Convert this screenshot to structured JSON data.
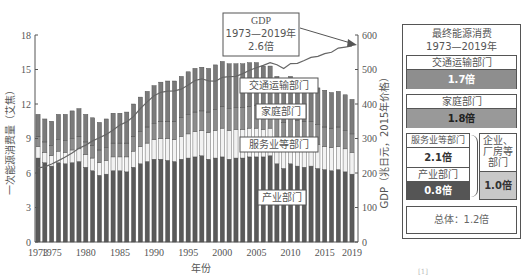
{
  "chart_data": {
    "type": "bar",
    "subtype": "stacked_bar_with_line",
    "title": "",
    "xlabel": "年份",
    "ylabel": "一次能源消费量（艾焦）",
    "y2label": "GDP（兆日元，2015年价格）",
    "ylim": [
      0,
      18
    ],
    "y2lim": [
      0,
      600
    ],
    "yticks": [
      0,
      3,
      6,
      9,
      12,
      15,
      18
    ],
    "y2ticks": [
      0,
      100,
      200,
      300,
      400,
      500,
      600
    ],
    "xtick_labels": [
      "1973",
      "1975",
      "1980",
      "1985",
      "1990",
      "1995",
      "2000",
      "2005",
      "2010",
      "2015",
      "2019"
    ],
    "categories": [
      1973,
      1974,
      1975,
      1976,
      1977,
      1978,
      1979,
      1980,
      1981,
      1982,
      1983,
      1984,
      1985,
      1986,
      1987,
      1988,
      1989,
      1990,
      1991,
      1992,
      1993,
      1994,
      1995,
      1996,
      1997,
      1998,
      1999,
      2000,
      2001,
      2002,
      2003,
      2004,
      2005,
      2006,
      2007,
      2008,
      2009,
      2010,
      2011,
      2012,
      2013,
      2014,
      2015,
      2016,
      2017,
      2018,
      2019
    ],
    "series": [
      {
        "name": "产业部门",
        "color": "#5a5a5a",
        "values": [
          7.3,
          6.9,
          6.6,
          6.9,
          6.8,
          6.9,
          7.0,
          6.5,
          6.2,
          5.8,
          5.9,
          6.2,
          6.2,
          6.1,
          6.5,
          6.8,
          7.0,
          7.2,
          7.2,
          7.1,
          7.0,
          7.2,
          7.3,
          7.4,
          7.5,
          7.2,
          7.3,
          7.4,
          7.2,
          7.3,
          7.3,
          7.4,
          7.4,
          7.4,
          7.5,
          6.8,
          6.4,
          6.8,
          6.6,
          6.5,
          6.6,
          6.4,
          6.3,
          6.2,
          6.3,
          6.1,
          5.9
        ]
      },
      {
        "name": "服务业等部门",
        "color": "#f2f2f2",
        "values": [
          1.0,
          0.9,
          0.9,
          1.0,
          1.0,
          1.1,
          1.1,
          1.1,
          1.1,
          1.1,
          1.2,
          1.2,
          1.2,
          1.3,
          1.4,
          1.5,
          1.6,
          1.7,
          1.8,
          1.9,
          1.9,
          2.0,
          2.1,
          2.2,
          2.2,
          2.3,
          2.4,
          2.5,
          2.5,
          2.5,
          2.5,
          2.5,
          2.5,
          2.4,
          2.4,
          2.3,
          2.2,
          2.3,
          2.2,
          2.2,
          2.1,
          2.1,
          2.0,
          2.0,
          2.0,
          2.0,
          1.9
        ]
      },
      {
        "name": "家庭部门",
        "color": "#8c8c8c",
        "values": [
          0.9,
          0.9,
          0.9,
          1.0,
          1.0,
          1.0,
          1.1,
          1.1,
          1.1,
          1.1,
          1.1,
          1.2,
          1.2,
          1.2,
          1.3,
          1.3,
          1.4,
          1.4,
          1.5,
          1.5,
          1.6,
          1.6,
          1.7,
          1.7,
          1.7,
          1.8,
          1.8,
          1.9,
          1.9,
          1.9,
          1.9,
          1.9,
          2.0,
          1.9,
          1.9,
          1.9,
          1.8,
          1.9,
          1.8,
          1.8,
          1.8,
          1.7,
          1.7,
          1.7,
          1.7,
          1.6,
          1.6
        ]
      },
      {
        "name": "交通运输部门",
        "color": "#7a7a7a",
        "values": [
          1.9,
          2.0,
          2.1,
          2.2,
          2.3,
          2.4,
          2.4,
          2.4,
          2.4,
          2.4,
          2.5,
          2.6,
          2.6,
          2.7,
          2.8,
          3.0,
          3.1,
          3.3,
          3.4,
          3.5,
          3.5,
          3.6,
          3.7,
          3.8,
          3.8,
          3.8,
          3.9,
          3.9,
          3.9,
          3.8,
          3.8,
          3.8,
          3.7,
          3.6,
          3.5,
          3.4,
          3.3,
          3.4,
          3.3,
          3.3,
          3.2,
          3.2,
          3.2,
          3.1,
          3.1,
          3.1,
          3.0
        ]
      },
      {
        "name": "GDP",
        "type": "line",
        "axis": "y2",
        "color": "#666666",
        "values": [
          215,
          218,
          226,
          236,
          246,
          258,
          272,
          281,
          293,
          302,
          312,
          325,
          339,
          348,
          364,
          387,
          406,
          424,
          434,
          437,
          438,
          443,
          455,
          468,
          473,
          467,
          466,
          477,
          479,
          480,
          488,
          498,
          505,
          512,
          520,
          514,
          503,
          517,
          518,
          526,
          535,
          538,
          546,
          550,
          562,
          565,
          568
        ]
      }
    ],
    "annotations": [
      {
        "text": "GDP\n1973—2019年\n2.6倍",
        "target": "GDP line end"
      },
      {
        "text": "交通运输部门"
      },
      {
        "text": "家庭部门"
      },
      {
        "text": "服务业等部门"
      },
      {
        "text": "产业部门"
      }
    ],
    "grid": false,
    "legend_position": "inline labels"
  },
  "axes": {
    "xlabel": "年份",
    "ylabel": "一次能源消费量（艾焦）",
    "y2label": "GDP（兆日元，2015年价格）",
    "yticks": [
      "0",
      "3",
      "6",
      "9",
      "12",
      "15",
      "18"
    ],
    "y2ticks": [
      "0",
      "100",
      "200",
      "300",
      "400",
      "500",
      "600"
    ],
    "xticks": [
      "1973",
      "1975",
      "1980",
      "1985",
      "1990",
      "1995",
      "2000",
      "2005",
      "2010",
      "2015",
      "2019"
    ]
  },
  "labels": {
    "gdp_box": [
      "GDP",
      "1973—2019年",
      "2.6倍"
    ],
    "transport": "交通运输部门",
    "household": "家庭部门",
    "services": "服务业等部门",
    "industry": "产业部门"
  },
  "panel": {
    "title_line1": "最终能源消费",
    "title_line2": "1973—2019年",
    "transport_label": "交通运输部门",
    "transport_value": "1.7倍",
    "household_label": "家庭部门",
    "household_value": "1.8倍",
    "services_label": "服务业等部门",
    "services_value": "2.1倍",
    "industry_label": "产业部门",
    "industry_value": "0.8倍",
    "enterprise_label_1": "企业、",
    "enterprise_label_2": "厂房等",
    "enterprise_label_3": "部门",
    "enterprise_value": "1.0倍",
    "total": "总体：1.2倍"
  },
  "footnote": "[1]"
}
